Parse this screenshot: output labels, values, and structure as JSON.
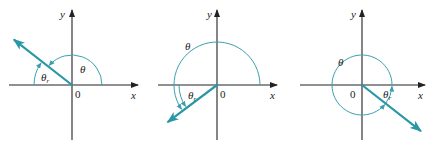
{
  "figure": {
    "colors": {
      "axis": "#222222",
      "vector": "#2a97a6",
      "arc": "#3aa0ae"
    },
    "labels": {
      "x_axis": "x",
      "y_axis": "y",
      "origin": "0",
      "angle": "θ",
      "reference_angle": "θ",
      "reference_sub": "r"
    },
    "panels": [
      {
        "id": "quadrant-II",
        "origin": [
          72,
          85
        ],
        "x_axis": [
          9,
          138
        ],
        "y_axis": [
          140,
          10
        ],
        "vector_angle_deg": 142,
        "vector_length": 73,
        "theta_arc_radius": 30,
        "theta_label_pos": [
          80,
          64
        ],
        "theta_r_arc_radius": 38,
        "theta_r_label_pos": [
          41,
          72
        ],
        "y_label_pos": [
          60,
          9
        ],
        "x_label_pos": [
          131,
          90
        ],
        "origin_label_pos": [
          75,
          89
        ]
      },
      {
        "id": "quadrant-III",
        "origin": [
          217,
          85
        ],
        "x_axis": [
          158,
          277
        ],
        "y_axis": [
          140,
          10
        ],
        "vector_angle_deg": 217,
        "vector_length": 61,
        "theta_arc_radius": 43,
        "theta_label_pos": [
          185,
          41
        ],
        "theta_r_arc_radius": 38,
        "theta_r_label_pos": [
          188,
          90
        ],
        "y_label_pos": [
          207,
          9
        ],
        "x_label_pos": [
          270,
          90
        ],
        "origin_label_pos": [
          220,
          89
        ]
      },
      {
        "id": "quadrant-IV",
        "origin": [
          362,
          85
        ],
        "x_axis": [
          300,
          425
        ],
        "y_axis": [
          140,
          10
        ],
        "vector_angle_deg": -38,
        "vector_length": 74,
        "theta_arc_radius": 30,
        "theta_label_pos": [
          338,
          57
        ],
        "theta_r_arc_radius": 30,
        "theta_r_label_pos": [
          383,
          89
        ],
        "y_label_pos": [
          351,
          9
        ],
        "x_label_pos": [
          418,
          90
        ],
        "origin_label_pos": [
          350,
          89
        ]
      }
    ]
  }
}
